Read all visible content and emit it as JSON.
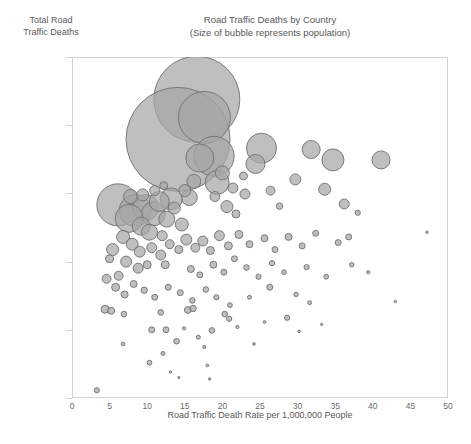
{
  "chart_data": {
    "type": "scatter",
    "title": "Road Traffic Deaths by Country",
    "subtitle": "(Size of bubble represents population)",
    "xlabel": "Road Traffic Death Rate per 1,000,000 People",
    "ylabel_line1": "Total Road",
    "ylabel_line2": "Traffic Deaths",
    "xlim": [
      0,
      50
    ],
    "ylim": [
      10,
      1000000
    ],
    "yscale": "log",
    "xticks": [
      0,
      5,
      10,
      15,
      20,
      25,
      30,
      35,
      40,
      45,
      50
    ],
    "xtick_labels": [
      "0",
      "5",
      "10",
      "15",
      "20",
      "25",
      "30",
      "35",
      "40",
      "45",
      "50"
    ],
    "yticks": [
      10,
      100,
      1000,
      10000,
      100000,
      1000000
    ],
    "ytick_labels": [
      "10",
      "100",
      "1,000",
      "10,000",
      "100,000",
      "1,000,000"
    ],
    "grid": false,
    "legend": "none",
    "bubble_fill": "#a6a6a6",
    "bubble_stroke": "#6f6f6f",
    "bubble_opacity": 0.72,
    "frame_color": "#d2d2d4",
    "text_color": "#58585a",
    "size_encodes": "population",
    "points": [
      {
        "x": 16.6,
        "y": 240000,
        "r": 43
      },
      {
        "x": 14.1,
        "y": 62000,
        "r": 52
      },
      {
        "x": 17.6,
        "y": 130000,
        "r": 26
      },
      {
        "x": 18.9,
        "y": 35000,
        "r": 20
      },
      {
        "x": 17.0,
        "y": 33000,
        "r": 14
      },
      {
        "x": 19.3,
        "y": 14500,
        "r": 12
      },
      {
        "x": 15.6,
        "y": 8700,
        "r": 8
      },
      {
        "x": 13.2,
        "y": 8300,
        "r": 11
      },
      {
        "x": 25.2,
        "y": 46000,
        "r": 15
      },
      {
        "x": 24.4,
        "y": 27000,
        "r": 9.5
      },
      {
        "x": 31.8,
        "y": 44000,
        "r": 9
      },
      {
        "x": 34.7,
        "y": 31000,
        "r": 11
      },
      {
        "x": 41.1,
        "y": 31000,
        "r": 9
      },
      {
        "x": 29.7,
        "y": 16000,
        "r": 5.5
      },
      {
        "x": 33.6,
        "y": 11500,
        "r": 6
      },
      {
        "x": 36.2,
        "y": 7000,
        "r": 5
      },
      {
        "x": 26.4,
        "y": 11000,
        "r": 4.5
      },
      {
        "x": 23.0,
        "y": 9800,
        "r": 5
      },
      {
        "x": 27.6,
        "y": 6500,
        "r": 3.2
      },
      {
        "x": 20.6,
        "y": 6400,
        "r": 6
      },
      {
        "x": 21.8,
        "y": 5000,
        "r": 4
      },
      {
        "x": 6.1,
        "y": 6800,
        "r": 21
      },
      {
        "x": 8.4,
        "y": 5600,
        "r": 16
      },
      {
        "x": 9.8,
        "y": 6200,
        "r": 13
      },
      {
        "x": 10.8,
        "y": 5000,
        "r": 12
      },
      {
        "x": 7.6,
        "y": 4300,
        "r": 14
      },
      {
        "x": 11.6,
        "y": 7600,
        "r": 10
      },
      {
        "x": 12.6,
        "y": 4200,
        "r": 8
      },
      {
        "x": 9.2,
        "y": 3300,
        "r": 9
      },
      {
        "x": 10.3,
        "y": 2700,
        "r": 8
      },
      {
        "x": 13.6,
        "y": 6100,
        "r": 6
      },
      {
        "x": 14.6,
        "y": 3500,
        "r": 6.5
      },
      {
        "x": 12.0,
        "y": 2400,
        "r": 5
      },
      {
        "x": 6.8,
        "y": 2300,
        "r": 6.5
      },
      {
        "x": 8.0,
        "y": 1800,
        "r": 6
      },
      {
        "x": 5.4,
        "y": 1500,
        "r": 6
      },
      {
        "x": 9.0,
        "y": 1400,
        "r": 5.5
      },
      {
        "x": 10.6,
        "y": 1600,
        "r": 5
      },
      {
        "x": 11.8,
        "y": 1250,
        "r": 5
      },
      {
        "x": 13.0,
        "y": 1800,
        "r": 4.5
      },
      {
        "x": 7.2,
        "y": 1000,
        "r": 5.5
      },
      {
        "x": 8.8,
        "y": 800,
        "r": 5
      },
      {
        "x": 10.0,
        "y": 900,
        "r": 4
      },
      {
        "x": 6.2,
        "y": 620,
        "r": 4.5
      },
      {
        "x": 5.0,
        "y": 1100,
        "r": 4
      },
      {
        "x": 12.4,
        "y": 900,
        "r": 4
      },
      {
        "x": 14.2,
        "y": 1500,
        "r": 4
      },
      {
        "x": 15.2,
        "y": 2100,
        "r": 5.5
      },
      {
        "x": 16.4,
        "y": 1600,
        "r": 4.5
      },
      {
        "x": 17.4,
        "y": 2000,
        "r": 5
      },
      {
        "x": 18.4,
        "y": 1450,
        "r": 4
      },
      {
        "x": 19.6,
        "y": 2400,
        "r": 5
      },
      {
        "x": 20.8,
        "y": 1700,
        "r": 4
      },
      {
        "x": 22.2,
        "y": 2500,
        "r": 4
      },
      {
        "x": 23.6,
        "y": 1800,
        "r": 3.5
      },
      {
        "x": 25.6,
        "y": 2200,
        "r": 3.5
      },
      {
        "x": 27.0,
        "y": 1500,
        "r": 3
      },
      {
        "x": 28.8,
        "y": 2300,
        "r": 3.5
      },
      {
        "x": 30.6,
        "y": 1700,
        "r": 3
      },
      {
        "x": 32.4,
        "y": 2600,
        "r": 3
      },
      {
        "x": 35.4,
        "y": 1900,
        "r": 3
      },
      {
        "x": 15.8,
        "y": 780,
        "r": 3.5
      },
      {
        "x": 17.0,
        "y": 640,
        "r": 3
      },
      {
        "x": 18.8,
        "y": 900,
        "r": 3.5
      },
      {
        "x": 20.2,
        "y": 700,
        "r": 3
      },
      {
        "x": 21.6,
        "y": 1100,
        "r": 3
      },
      {
        "x": 23.2,
        "y": 820,
        "r": 2.8
      },
      {
        "x": 24.8,
        "y": 600,
        "r": 2.6
      },
      {
        "x": 26.6,
        "y": 950,
        "r": 2.6
      },
      {
        "x": 28.2,
        "y": 700,
        "r": 2.4
      },
      {
        "x": 31.2,
        "y": 830,
        "r": 2.6
      },
      {
        "x": 33.8,
        "y": 600,
        "r": 2.4
      },
      {
        "x": 4.6,
        "y": 560,
        "r": 4.5
      },
      {
        "x": 5.8,
        "y": 420,
        "r": 4
      },
      {
        "x": 7.0,
        "y": 330,
        "r": 3.5
      },
      {
        "x": 8.2,
        "y": 470,
        "r": 3.5
      },
      {
        "x": 9.6,
        "y": 380,
        "r": 3.2
      },
      {
        "x": 11.0,
        "y": 300,
        "r": 3
      },
      {
        "x": 12.8,
        "y": 420,
        "r": 3
      },
      {
        "x": 14.4,
        "y": 350,
        "r": 3
      },
      {
        "x": 16.0,
        "y": 270,
        "r": 2.8
      },
      {
        "x": 17.8,
        "y": 390,
        "r": 2.8
      },
      {
        "x": 19.2,
        "y": 300,
        "r": 2.6
      },
      {
        "x": 21.0,
        "y": 230,
        "r": 2.4
      },
      {
        "x": 4.4,
        "y": 200,
        "r": 4
      },
      {
        "x": 5.2,
        "y": 190,
        "r": 3.5
      },
      {
        "x": 6.9,
        "y": 170,
        "r": 2.8
      },
      {
        "x": 11.8,
        "y": 180,
        "r": 2.8
      },
      {
        "x": 15.4,
        "y": 195,
        "r": 3.4
      },
      {
        "x": 16.1,
        "y": 205,
        "r": 3.2
      },
      {
        "x": 20.3,
        "y": 170,
        "r": 2.8
      },
      {
        "x": 20.9,
        "y": 145,
        "r": 2.6
      },
      {
        "x": 10.6,
        "y": 100,
        "r": 3
      },
      {
        "x": 12.5,
        "y": 100,
        "r": 3
      },
      {
        "x": 14.9,
        "y": 105,
        "r": 1.6
      },
      {
        "x": 18.6,
        "y": 98,
        "r": 2.8
      },
      {
        "x": 6.8,
        "y": 62,
        "r": 1.8
      },
      {
        "x": 13.9,
        "y": 68,
        "r": 2.8
      },
      {
        "x": 16.8,
        "y": 78,
        "r": 2
      },
      {
        "x": 17.6,
        "y": 56,
        "r": 1.6
      },
      {
        "x": 12.1,
        "y": 45,
        "r": 2
      },
      {
        "x": 10.3,
        "y": 33,
        "r": 2.4
      },
      {
        "x": 18.0,
        "y": 30,
        "r": 1.4
      },
      {
        "x": 13.1,
        "y": 24,
        "r": 1.2
      },
      {
        "x": 14.2,
        "y": 20,
        "r": 1.1
      },
      {
        "x": 18.3,
        "y": 19,
        "r": 1.2
      },
      {
        "x": 3.3,
        "y": 13,
        "r": 2.6
      },
      {
        "x": 23.6,
        "y": 300,
        "r": 2
      },
      {
        "x": 22.0,
        "y": 110,
        "r": 1.6
      },
      {
        "x": 25.6,
        "y": 130,
        "r": 1.4
      },
      {
        "x": 24.2,
        "y": 62,
        "r": 1.3
      },
      {
        "x": 28.6,
        "y": 150,
        "r": 2.6
      },
      {
        "x": 26.3,
        "y": 420,
        "r": 3
      },
      {
        "x": 29.8,
        "y": 330,
        "r": 2.2
      },
      {
        "x": 31.6,
        "y": 250,
        "r": 2
      },
      {
        "x": 30.2,
        "y": 95,
        "r": 1.3
      },
      {
        "x": 33.2,
        "y": 120,
        "r": 1.2
      },
      {
        "x": 36.8,
        "y": 2300,
        "r": 3
      },
      {
        "x": 38.0,
        "y": 5200,
        "r": 2.6
      },
      {
        "x": 37.2,
        "y": 900,
        "r": 2.2
      },
      {
        "x": 39.4,
        "y": 700,
        "r": 1.6
      },
      {
        "x": 47.2,
        "y": 2700,
        "r": 1.2
      },
      {
        "x": 43.0,
        "y": 260,
        "r": 1.2
      },
      {
        "x": 12.2,
        "y": 13000,
        "r": 4
      },
      {
        "x": 11.0,
        "y": 11000,
        "r": 5
      },
      {
        "x": 20.0,
        "y": 20000,
        "r": 7
      },
      {
        "x": 21.4,
        "y": 12000,
        "r": 5
      },
      {
        "x": 22.8,
        "y": 18000,
        "r": 4
      },
      {
        "x": 19.0,
        "y": 9000,
        "r": 5
      },
      {
        "x": 16.2,
        "y": 15000,
        "r": 7
      },
      {
        "x": 15.0,
        "y": 11000,
        "r": 6
      },
      {
        "x": 7.8,
        "y": 9000,
        "r": 7
      },
      {
        "x": 9.4,
        "y": 9500,
        "r": 6
      }
    ]
  }
}
